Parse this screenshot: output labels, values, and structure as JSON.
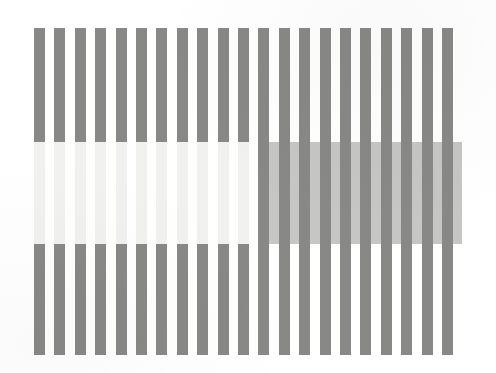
{
  "canvas": {
    "width": 496,
    "height": 373,
    "background": "#ffffff"
  },
  "figure": {
    "name": "whites-illusion-figure",
    "left": 34,
    "top": 28,
    "width": 428,
    "height": 327
  },
  "grating": {
    "stripe_color": "#888886",
    "gap_color": "#ffffff",
    "stripe_width": 11,
    "period": 20.4,
    "stripe_count": 21,
    "orientation": "vertical"
  },
  "test_band": {
    "top": 142,
    "height": 102,
    "split_x": 224,
    "left_half": {
      "label": "light-test-patch",
      "color": "#f1f1ef",
      "blend": "lighten",
      "note": "Test patches replace the dark bars, appearing light"
    },
    "right_half": {
      "label": "dark-test-patch",
      "color": "#c6c6c4",
      "blend": "darken",
      "note": "Test patches replace the white gaps, appearing darker"
    }
  },
  "colors": {
    "page_background": "#ffffff",
    "bar_gray": "#888886",
    "light_patch": "#f1f1ef",
    "dark_patch": "#c6c6c4"
  }
}
